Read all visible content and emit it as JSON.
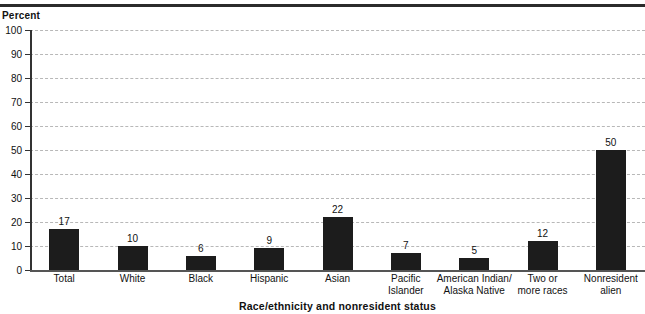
{
  "figure": {
    "y_axis_title": "Percent",
    "x_axis_title": "Race/ethnicity and nonresident status",
    "bar_color": "#1c1c1c",
    "gridline_color": "#b8b8b8",
    "axis_color": "#333333",
    "background": "#ffffff"
  },
  "chart_data": {
    "type": "bar",
    "title": "",
    "subtitle": "",
    "xlabel": "Race/ethnicity and nonresident status",
    "ylabel": "Percent",
    "ylim": [
      0,
      100
    ],
    "yticks": [
      0,
      10,
      20,
      30,
      40,
      50,
      60,
      70,
      80,
      90,
      100
    ],
    "ytick_labels": [
      "0",
      "10",
      "20",
      "30",
      "40",
      "50",
      "60",
      "70",
      "80",
      "90",
      "100"
    ],
    "grid": true,
    "grid_axis": "y",
    "grid_style": "dashed",
    "legend": false,
    "legend_position": "none",
    "categories": [
      "Total",
      "White",
      "Black",
      "Hispanic",
      "Asian",
      "Pacific Islander",
      "American Indian/ Alaska Native",
      "Two or more races",
      "Nonresident alien"
    ],
    "category_lines": [
      [
        "Total"
      ],
      [
        "White"
      ],
      [
        "Black"
      ],
      [
        "Hispanic"
      ],
      [
        "Asian"
      ],
      [
        "Pacific",
        "Islander"
      ],
      [
        "American Indian/",
        "Alaska Native"
      ],
      [
        "Two or",
        "more races"
      ],
      [
        "Nonresident",
        "alien"
      ]
    ],
    "values": [
      17,
      10,
      6,
      9,
      22,
      7,
      5,
      12,
      50
    ],
    "value_labels": [
      "17",
      "10",
      "6",
      "9",
      "22",
      "7",
      "5",
      "12",
      "50"
    ]
  }
}
